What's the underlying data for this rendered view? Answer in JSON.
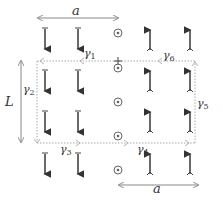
{
  "labels": {
    "top_width": "a",
    "bottom_width": "a",
    "height": "L",
    "gamma": "γ",
    "gamma1_sub": "1",
    "gamma2_sub": "2",
    "gamma3_sub": "3",
    "gamma4_sub": "4",
    "gamma5_sub": "5",
    "gamma6_sub": "6"
  },
  "elements": {
    "down_arrow_columns": 2,
    "up_arrow_columns": 2,
    "rows": 4,
    "out_of_page_dots": 5
  },
  "colors": {
    "arrow": "#444444",
    "dashed_path": "#aaaaaa",
    "dimension": "#888888"
  }
}
